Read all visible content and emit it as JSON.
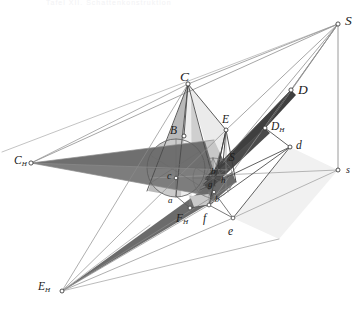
{
  "figure": {
    "kind": "descriptive-geometry-plate",
    "header_faint": "Tafel  XII.  Schattenkonstruktion",
    "background": "#ffffff",
    "ink": "#1b1b1b",
    "line_light": "#8a8a8a",
    "line_mid": "#5d5d5d",
    "fill_dark_wedge": "#6f6f6f",
    "fill_mid_wedge": "#8d8d8d",
    "fill_cone_light": "#d2d2d2",
    "fill_cone_dark": "#9a9a9a",
    "fill_circle": "#cdcdcd",
    "fill_pale": "#e6e6e6"
  },
  "labels": [
    {
      "id": "S",
      "text": "S",
      "sub": "",
      "x": 345,
      "y": 14,
      "size": "L14"
    },
    {
      "id": "D",
      "text": "D",
      "sub": "",
      "x": 298,
      "y": 83,
      "size": "L14"
    },
    {
      "id": "C",
      "text": "C",
      "sub": "",
      "x": 180,
      "y": 70,
      "size": "L14"
    },
    {
      "id": "DH",
      "text": "D",
      "sub": "H",
      "x": 271,
      "y": 121,
      "size": "L12"
    },
    {
      "id": "E",
      "text": "E",
      "sub": "",
      "x": 222,
      "y": 114,
      "size": "L12"
    },
    {
      "id": "d",
      "text": "d",
      "sub": "",
      "x": 296,
      "y": 140,
      "size": "L12"
    },
    {
      "id": "B",
      "text": "B",
      "sub": "",
      "x": 170,
      "y": 125,
      "size": "L12"
    },
    {
      "id": "CH",
      "text": "C",
      "sub": "H",
      "x": 14,
      "y": 155,
      "size": "L12"
    },
    {
      "id": "s",
      "text": "s",
      "sub": "",
      "x": 346,
      "y": 165,
      "size": "L10"
    },
    {
      "id": "Sm",
      "text": "S",
      "sub": "",
      "x": 229,
      "y": 152,
      "size": "L12"
    },
    {
      "id": "c",
      "text": "c",
      "sub": "",
      "x": 167,
      "y": 171,
      "size": "L10"
    },
    {
      "id": "bm",
      "text": "b",
      "sub": "",
      "x": 211,
      "y": 167,
      "size": "L9"
    },
    {
      "id": "gm",
      "text": "g",
      "sub": "",
      "x": 208,
      "y": 180,
      "size": "L9"
    },
    {
      "id": "hm",
      "text": "h",
      "sub": "",
      "x": 221,
      "y": 176,
      "size": "L9"
    },
    {
      "id": "am",
      "text": "a",
      "sub": "",
      "x": 168,
      "y": 196,
      "size": "L9"
    },
    {
      "id": "FH",
      "text": "F",
      "sub": "H",
      "x": 176,
      "y": 213,
      "size": "L12"
    },
    {
      "id": "f",
      "text": "f",
      "sub": "",
      "x": 203,
      "y": 213,
      "size": "L12"
    },
    {
      "id": "e",
      "text": "e",
      "sub": "",
      "x": 228,
      "y": 226,
      "size": "L12"
    },
    {
      "id": "bs",
      "text": "b",
      "sub": "",
      "x": 215,
      "y": 196,
      "size": "L8"
    },
    {
      "id": "EH",
      "text": "E",
      "sub": "H",
      "x": 38,
      "y": 281,
      "size": "L12"
    }
  ],
  "nodes": [
    {
      "id": "S",
      "x": 338,
      "y": 24
    },
    {
      "id": "D",
      "x": 291,
      "y": 90
    },
    {
      "id": "C",
      "x": 188,
      "y": 84
    },
    {
      "id": "DH",
      "x": 265,
      "y": 128
    },
    {
      "id": "E",
      "x": 226,
      "y": 130
    },
    {
      "id": "d",
      "x": 290,
      "y": 147
    },
    {
      "id": "B",
      "x": 184,
      "y": 136
    },
    {
      "id": "CH",
      "x": 31,
      "y": 163
    },
    {
      "id": "s",
      "x": 338,
      "y": 170
    },
    {
      "id": "Sm",
      "x": 223,
      "y": 163
    },
    {
      "id": "c",
      "x": 176,
      "y": 178
    },
    {
      "id": "FH",
      "x": 190,
      "y": 208
    },
    {
      "id": "f",
      "x": 209,
      "y": 205
    },
    {
      "id": "e",
      "x": 233,
      "y": 218
    },
    {
      "id": "EH",
      "x": 62,
      "y": 291
    }
  ]
}
